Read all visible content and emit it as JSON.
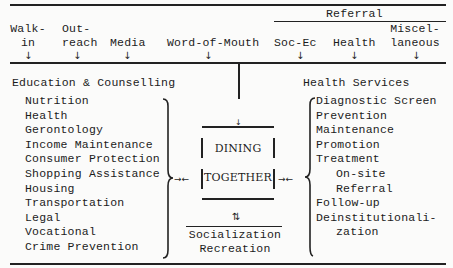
{
  "sources": {
    "walk_in": [
      "Walk-",
      "in"
    ],
    "outreach": [
      "Out-",
      "reach"
    ],
    "media": "Media",
    "word_of_mouth": "Word-of-Mouth",
    "referral_heading": "Referral",
    "soc_ec": "Soc-Ec",
    "health": "Health",
    "miscellaneous": [
      "Miscel-",
      "laneous"
    ]
  },
  "education": {
    "title": "Education & Counselling",
    "items": [
      "Nutrition",
      "Health",
      "Gerontology",
      "Income Maintenance",
      "Consumer Protection",
      "Shopping Assistance",
      "Housing",
      "Transportation",
      "Legal",
      "Vocational",
      "Crime Prevention"
    ]
  },
  "center": {
    "line1": "DINING",
    "line2": "TOGETHER",
    "social1": "Socialization",
    "social2": "Recreation"
  },
  "health_services": {
    "title": "Health Services",
    "items": [
      "Diagnostic Screen",
      "Prevention",
      "Maintenance",
      "Promotion",
      "Treatment",
      "On-site",
      "Referral",
      "Follow-up",
      "Deinstitutionali-",
      "zation"
    ]
  }
}
